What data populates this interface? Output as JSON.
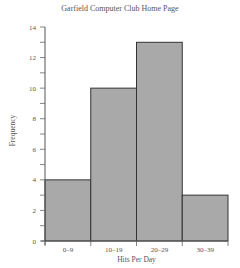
{
  "chart_data": {
    "type": "bar",
    "subtype": "histogram",
    "title": "Garfield Computer Club Home Page",
    "xlabel": "Hits Per Day",
    "ylabel": "Frequency",
    "categories": [
      "0–9",
      "10–19",
      "20–29",
      "30–39"
    ],
    "values": [
      4,
      10,
      13,
      3
    ],
    "ylim": [
      0,
      14
    ],
    "yticks": [
      0,
      2,
      4,
      6,
      8,
      10,
      12,
      14
    ],
    "minor_ytick_step": 1,
    "grid": false,
    "legend": null,
    "bar_color": "#a9a9a9",
    "bar_edge_color": "#333333"
  }
}
